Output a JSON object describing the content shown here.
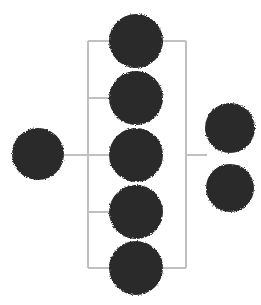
{
  "canvas": {
    "width": 261,
    "height": 305,
    "background": "#ffffff",
    "title": "node-link cluster diagram"
  },
  "style": {
    "node_fill": "#2b2b2b",
    "node_radius": 26,
    "link_color": "#c0c0c0",
    "link_width": 1.6
  },
  "nodes": [
    {
      "id": "root-left",
      "name": "node-root-left",
      "cx": 38,
      "cy": 154,
      "r": 26,
      "fill": "#2b2b2b"
    },
    {
      "id": "cluster-1",
      "name": "node-cluster-1",
      "cx": 136,
      "cy": 41,
      "r": 27,
      "fill": "#2b2b2b"
    },
    {
      "id": "cluster-2",
      "name": "node-cluster-2",
      "cx": 136,
      "cy": 98,
      "r": 27,
      "fill": "#2b2b2b"
    },
    {
      "id": "cluster-3",
      "name": "node-cluster-3",
      "cx": 136,
      "cy": 155,
      "r": 27,
      "fill": "#2b2b2b"
    },
    {
      "id": "cluster-4",
      "name": "node-cluster-4",
      "cx": 136,
      "cy": 212,
      "r": 27,
      "fill": "#2b2b2b"
    },
    {
      "id": "cluster-5",
      "name": "node-cluster-5",
      "cx": 136,
      "cy": 268,
      "r": 27,
      "fill": "#2b2b2b"
    },
    {
      "id": "leaf-right-top",
      "name": "node-leaf-right-top",
      "cx": 230,
      "cy": 128,
      "r": 25,
      "fill": "#2b2b2b"
    },
    {
      "id": "leaf-right-bot",
      "name": "node-leaf-right-bot",
      "cx": 230,
      "cy": 188,
      "r": 24,
      "fill": "#2b2b2b"
    }
  ],
  "links": [
    {
      "id": "root-connector",
      "name": "link-root-connector",
      "x1": 64,
      "y1": 155,
      "x2": 88,
      "y2": 155
    },
    {
      "id": "spine-left",
      "name": "link-spine-left",
      "x1": 88,
      "y1": 41,
      "x2": 88,
      "y2": 268
    },
    {
      "id": "spine-right",
      "name": "link-spine-right",
      "x1": 186,
      "y1": 41,
      "x2": 186,
      "y2": 268
    },
    {
      "id": "bracket-top",
      "name": "link-bracket-top",
      "x1": 88,
      "y1": 41,
      "x2": 186,
      "y2": 41
    },
    {
      "id": "bracket-bottom",
      "name": "link-bracket-bottom",
      "x1": 88,
      "y1": 268,
      "x2": 186,
      "y2": 268
    },
    {
      "id": "branch-1",
      "name": "link-branch-1",
      "x1": 88,
      "y1": 41,
      "x2": 115,
      "y2": 41
    },
    {
      "id": "branch-2",
      "name": "link-branch-2",
      "x1": 88,
      "y1": 98,
      "x2": 115,
      "y2": 98
    },
    {
      "id": "branch-3",
      "name": "link-branch-3",
      "x1": 88,
      "y1": 155,
      "x2": 115,
      "y2": 155
    },
    {
      "id": "branch-4",
      "name": "link-branch-4",
      "x1": 88,
      "y1": 212,
      "x2": 115,
      "y2": 212
    },
    {
      "id": "stub-right",
      "name": "link-stub-right",
      "x1": 186,
      "y1": 155,
      "x2": 207,
      "y2": 155
    }
  ]
}
